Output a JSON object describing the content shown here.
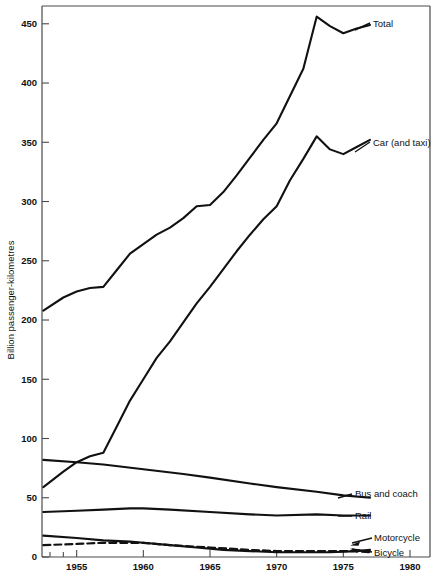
{
  "chart_data": {
    "type": "line",
    "title": "",
    "xlabel": "",
    "ylabel": "Billion passenger-kilometres",
    "xlim": [
      1952.4,
      1981.5
    ],
    "ylim": [
      0,
      465
    ],
    "grid": false,
    "legend_position": "inline-right-of-series",
    "x_ticks": [
      1955,
      1960,
      1965,
      1970,
      1975,
      1980
    ],
    "x_tick_labels": [
      "1955",
      "1960",
      "1965",
      "1970",
      "1975",
      "1980"
    ],
    "y_ticks": [
      0,
      50,
      100,
      150,
      200,
      250,
      300,
      350,
      400,
      450
    ],
    "y_tick_labels": [
      "0",
      "50",
      "100",
      "150",
      "200",
      "250",
      "300",
      "350",
      "400",
      "450"
    ],
    "series": [
      {
        "name": "Total",
        "label": "Total",
        "style": "solid",
        "color": "#111111",
        "x": [
          1952.5,
          1954,
          1955,
          1956,
          1957,
          1958,
          1959,
          1960,
          1961,
          1962,
          1963,
          1964,
          1965,
          1966,
          1967,
          1968,
          1969,
          1970,
          1971,
          1972,
          1973,
          1974,
          1975,
          1976,
          1977
        ],
        "values": [
          208,
          219,
          224,
          227,
          228,
          242,
          256,
          264,
          272,
          278,
          286,
          296,
          297,
          308,
          322,
          337,
          352,
          366,
          389,
          412,
          456,
          448,
          442,
          446,
          449
        ]
      },
      {
        "name": "Car (and taxi)",
        "label": "Car (and taxi)",
        "style": "solid",
        "color": "#111111",
        "x": [
          1952.5,
          1954,
          1955,
          1956,
          1957,
          1958,
          1959,
          1960,
          1961,
          1962,
          1963,
          1964,
          1965,
          1966,
          1967,
          1968,
          1969,
          1970,
          1971,
          1972,
          1973,
          1974,
          1975,
          1976,
          1977
        ],
        "values": [
          59,
          72,
          80,
          85,
          88,
          110,
          132,
          150,
          168,
          182,
          198,
          214,
          228,
          243,
          258,
          272,
          285,
          296,
          318,
          336,
          355,
          344,
          340,
          346,
          352
        ]
      },
      {
        "name": "Bus and coach",
        "label": "Bus and coach",
        "style": "solid",
        "color": "#111111",
        "x": [
          1952.5,
          1955,
          1957,
          1960,
          1963,
          1965,
          1968,
          1970,
          1973,
          1975,
          1977
        ],
        "values": [
          82,
          80,
          78,
          74,
          70,
          67,
          62,
          59,
          55,
          52,
          50
        ]
      },
      {
        "name": "Rail",
        "label": "Rail",
        "style": "solid",
        "color": "#111111",
        "x": [
          1952.5,
          1955,
          1957,
          1959,
          1960,
          1962,
          1965,
          1968,
          1970,
          1973,
          1975,
          1977
        ],
        "values": [
          38,
          39,
          40,
          41,
          41,
          40,
          38,
          36,
          35,
          36,
          35,
          35
        ]
      },
      {
        "name": "Motorcycle",
        "label": "Motorcycle",
        "style": "solid",
        "color": "#111111",
        "x": [
          1952.5,
          1955,
          1957,
          1959,
          1960,
          1962,
          1964,
          1966,
          1968,
          1970,
          1972,
          1974,
          1976,
          1977
        ],
        "values": [
          18,
          16,
          14,
          13,
          12,
          10,
          8,
          6,
          5,
          4,
          4,
          4,
          5,
          6
        ]
      },
      {
        "name": "Bicycle",
        "label": "Bicycle",
        "style": "dashed",
        "color": "#111111",
        "x": [
          1952.5,
          1955,
          1957,
          1959,
          1960,
          1962,
          1965,
          1968,
          1970,
          1972,
          1974,
          1976,
          1977
        ],
        "values": [
          10,
          11,
          12,
          12,
          12,
          10,
          8,
          6,
          5,
          5,
          5,
          5,
          4
        ]
      }
    ],
    "annotations": [
      {
        "text": "Total",
        "attached_to": "Total",
        "pointer": "leader-line"
      },
      {
        "text": "Car (and taxi)",
        "attached_to": "Car (and taxi)",
        "pointer": "leader-line"
      },
      {
        "text": "Bus and coach",
        "attached_to": "Bus and coach",
        "pointer": "leader-line"
      },
      {
        "text": "Rail",
        "attached_to": "Rail",
        "pointer": "leader-line"
      },
      {
        "text": "Motorcycle",
        "attached_to": "Motorcycle",
        "pointer": "arrow"
      },
      {
        "text": "Bicycle",
        "attached_to": "Bicycle",
        "pointer": "arrow"
      }
    ]
  }
}
